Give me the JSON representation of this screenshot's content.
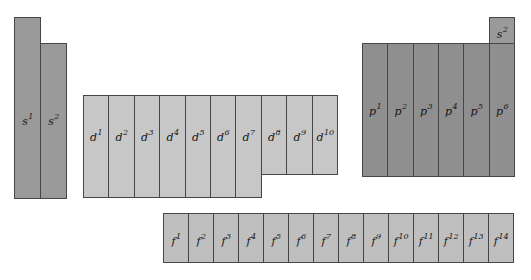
{
  "figure": {
    "background_color": "#ffffff",
    "border_color": "#464646",
    "label_color": "#161616"
  },
  "blocks": [
    {
      "id": "s-block",
      "color": "#9a9a9a",
      "cells": [
        {
          "base": "s",
          "sup": "1"
        },
        {
          "base": "s",
          "sup": "2"
        }
      ]
    },
    {
      "id": "d-block",
      "color": "#c7c7c7",
      "cells": [
        {
          "base": "d",
          "sup": "1"
        },
        {
          "base": "d",
          "sup": "2"
        },
        {
          "base": "d",
          "sup": "3"
        },
        {
          "base": "d",
          "sup": "4"
        },
        {
          "base": "d",
          "sup": "5"
        },
        {
          "base": "d",
          "sup": "6"
        },
        {
          "base": "d",
          "sup": "7"
        },
        {
          "base": "d",
          "sup": "8"
        },
        {
          "base": "d",
          "sup": "9"
        },
        {
          "base": "d",
          "sup": "10"
        }
      ]
    },
    {
      "id": "p-block",
      "color": "#8f8f8f",
      "cells": [
        {
          "base": "p",
          "sup": "1"
        },
        {
          "base": "p",
          "sup": "2"
        },
        {
          "base": "p",
          "sup": "3"
        },
        {
          "base": "p",
          "sup": "4"
        },
        {
          "base": "p",
          "sup": "5"
        },
        {
          "base": "p",
          "sup": "6"
        }
      ]
    },
    {
      "id": "f-block",
      "color": "#bfbfbf",
      "cells": [
        {
          "base": "f",
          "sup": "1"
        },
        {
          "base": "f",
          "sup": "2"
        },
        {
          "base": "f",
          "sup": "3"
        },
        {
          "base": "f",
          "sup": "4"
        },
        {
          "base": "f",
          "sup": "5"
        },
        {
          "base": "f",
          "sup": "6"
        },
        {
          "base": "f",
          "sup": "7"
        },
        {
          "base": "f",
          "sup": "8"
        },
        {
          "base": "f",
          "sup": "9"
        },
        {
          "base": "f",
          "sup": "10"
        },
        {
          "base": "f",
          "sup": "11"
        },
        {
          "base": "f",
          "sup": "12"
        },
        {
          "base": "f",
          "sup": "13"
        },
        {
          "base": "f",
          "sup": "14"
        }
      ]
    },
    {
      "id": "helium-cell",
      "color": "#9a9a9a",
      "cells": [
        {
          "base": "s",
          "sup": "2"
        }
      ]
    }
  ]
}
